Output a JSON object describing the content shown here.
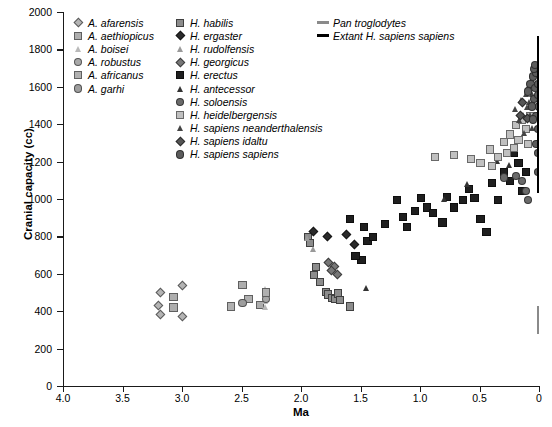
{
  "chart_data": {
    "type": "scatter",
    "title": "",
    "xlabel": "Ma",
    "ylabel": "Cranial capacity (cc)",
    "xlim": [
      4.0,
      0.0
    ],
    "ylim": [
      0,
      2000
    ],
    "x_reversed": true,
    "grid": false,
    "xticks": [
      "4.0",
      "3.5",
      "3.0",
      "2.5",
      "2.0",
      "1.5",
      "1.0",
      "0.5",
      "0"
    ],
    "xtick_values": [
      4.0,
      3.5,
      3.0,
      2.5,
      2.0,
      1.5,
      1.0,
      0.5,
      0.0
    ],
    "yticks": [
      "0",
      "200",
      "400",
      "600",
      "800",
      "1000",
      "1200",
      "1400",
      "1600",
      "1800",
      "2000"
    ],
    "ytick_values": [
      0,
      200,
      400,
      600,
      800,
      1000,
      1200,
      1400,
      1600,
      1800,
      2000
    ],
    "legend_position": "top",
    "series": [
      {
        "name": "A. afarensis",
        "marker": "diamond",
        "color": "#b4b4b4",
        "points": [
          [
            3.18,
            500
          ],
          [
            3.0,
            540
          ],
          [
            3.2,
            430
          ],
          [
            3.0,
            375
          ],
          [
            3.18,
            385
          ]
        ]
      },
      {
        "name": "A. aethiopicus",
        "marker": "square-open",
        "color": "#aeaeae",
        "points": [
          [
            3.08,
            480
          ],
          [
            3.08,
            425
          ],
          [
            2.5,
            545
          ],
          [
            2.35,
            440
          ]
        ]
      },
      {
        "name": "A. boisei",
        "marker": "triangle-open",
        "color": "#b9b9b9",
        "points": [
          [
            2.3,
            515
          ],
          [
            2.3,
            490
          ],
          [
            2.3,
            455
          ],
          [
            2.3,
            420
          ]
        ]
      },
      {
        "name": "A. robustus",
        "marker": "circle",
        "color": "#a8a8a8",
        "points": [
          [
            2.3,
            500
          ],
          [
            2.3,
            470
          ]
        ]
      },
      {
        "name": "A. africanus",
        "marker": "square-open",
        "color": "#b0b0b0",
        "points": [
          [
            2.6,
            430
          ],
          [
            2.45,
            470
          ],
          [
            2.3,
            505
          ]
        ]
      },
      {
        "name": "A. garhi",
        "marker": "circle",
        "color": "#9e9e9e",
        "points": [
          [
            2.5,
            450
          ]
        ]
      },
      {
        "name": "H. habilis",
        "marker": "square",
        "color": "#8c8c8c",
        "points": [
          [
            1.9,
            600
          ],
          [
            1.85,
            560
          ],
          [
            1.8,
            510
          ],
          [
            1.78,
            495
          ],
          [
            1.75,
            475
          ],
          [
            1.72,
            470
          ],
          [
            1.7,
            500
          ],
          [
            1.68,
            465
          ],
          [
            1.6,
            430
          ],
          [
            1.88,
            640
          ],
          [
            1.95,
            800
          ],
          [
            1.93,
            770
          ]
        ]
      },
      {
        "name": "H. ergaster",
        "marker": "diamond-filled",
        "color": "#2b2b2b",
        "points": [
          [
            1.9,
            830
          ],
          [
            1.78,
            800
          ],
          [
            1.62,
            810
          ],
          [
            1.55,
            760
          ]
        ]
      },
      {
        "name": "H. rudolfensis",
        "marker": "triangle-open",
        "color": "#9a9a9a",
        "points": [
          [
            1.95,
            790
          ],
          [
            1.9,
            730
          ]
        ]
      },
      {
        "name": "H. georgicus",
        "marker": "diamond",
        "color": "#777777",
        "points": [
          [
            1.77,
            660
          ],
          [
            1.72,
            640
          ],
          [
            1.75,
            620
          ],
          [
            1.7,
            600
          ]
        ]
      },
      {
        "name": "H. erectus",
        "marker": "square-filled",
        "color": "#1f1f1f",
        "points": [
          [
            1.6,
            900
          ],
          [
            1.48,
            855
          ],
          [
            1.45,
            780
          ],
          [
            1.4,
            800
          ],
          [
            1.3,
            870
          ],
          [
            1.2,
            1000
          ],
          [
            1.15,
            910
          ],
          [
            1.12,
            855
          ],
          [
            1.05,
            940
          ],
          [
            1.0,
            1010
          ],
          [
            0.95,
            960
          ],
          [
            0.9,
            930
          ],
          [
            0.82,
            880
          ],
          [
            0.78,
            1015
          ],
          [
            0.72,
            960
          ],
          [
            0.65,
            1000
          ],
          [
            0.6,
            1060
          ],
          [
            0.55,
            1010
          ],
          [
            0.5,
            900
          ],
          [
            0.45,
            830
          ],
          [
            0.4,
            1090
          ],
          [
            0.35,
            1000
          ],
          [
            0.3,
            1150
          ],
          [
            0.25,
            1100
          ],
          [
            0.22,
            1250
          ],
          [
            0.18,
            1200
          ],
          [
            0.15,
            1050
          ],
          [
            0.12,
            1150
          ],
          [
            1.5,
            680
          ],
          [
            1.55,
            700
          ]
        ]
      },
      {
        "name": "H. antecessor",
        "marker": "triangle-filled",
        "color": "#333333",
        "points": [
          [
            1.45,
            525
          ],
          [
            0.8,
            1000
          ],
          [
            0.6,
            1080
          ],
          [
            0.35,
            1200
          ],
          [
            0.25,
            1180
          ]
        ]
      },
      {
        "name": "H. soloensis",
        "marker": "circle",
        "color": "#6a6a6a",
        "points": [
          [
            0.15,
            1100
          ],
          [
            0.12,
            1050
          ],
          [
            0.1,
            1000
          ],
          [
            0.3,
            1120
          ],
          [
            0.2,
            1130
          ]
        ]
      },
      {
        "name": "H. heidelbergensis",
        "marker": "square-open",
        "color": "#c0c0c0",
        "points": [
          [
            0.72,
            1240
          ],
          [
            0.58,
            1220
          ],
          [
            0.5,
            1200
          ],
          [
            0.42,
            1270
          ],
          [
            0.4,
            1180
          ],
          [
            0.35,
            1230
          ],
          [
            0.3,
            1310
          ],
          [
            0.28,
            1250
          ],
          [
            0.25,
            1350
          ],
          [
            0.22,
            1280
          ],
          [
            0.2,
            1400
          ],
          [
            0.18,
            1320
          ],
          [
            0.15,
            1430
          ],
          [
            0.12,
            1380
          ],
          [
            0.88,
            1230
          ],
          [
            0.1,
            1300
          ],
          [
            0.08,
            1450
          ]
        ]
      },
      {
        "name": "H. sapiens neanderthalensis",
        "marker": "triangle-filled",
        "color": "#444444",
        "points": [
          [
            0.2,
            1480
          ],
          [
            0.17,
            1420
          ],
          [
            0.15,
            1530
          ],
          [
            0.13,
            1450
          ],
          [
            0.11,
            1560
          ],
          [
            0.1,
            1490
          ],
          [
            0.09,
            1600
          ],
          [
            0.08,
            1520
          ],
          [
            0.07,
            1450
          ],
          [
            0.06,
            1560
          ],
          [
            0.05,
            1620
          ],
          [
            0.04,
            1500
          ],
          [
            0.12,
            1350
          ],
          [
            0.06,
            1380
          ]
        ]
      },
      {
        "name": "H. sapiens idaltu",
        "marker": "diamond",
        "color": "#555555",
        "points": [
          [
            0.16,
            1450
          ],
          [
            0.14,
            1520
          ],
          [
            0.1,
            1430
          ]
        ]
      },
      {
        "name": "H. sapiens sapiens",
        "marker": "circle",
        "color": "#5c5c5c",
        "points": [
          [
            0.1,
            1580
          ],
          [
            0.08,
            1620
          ],
          [
            0.07,
            1500
          ],
          [
            0.06,
            1660
          ],
          [
            0.05,
            1540
          ],
          [
            0.04,
            1600
          ],
          [
            0.03,
            1450
          ],
          [
            0.03,
            1680
          ],
          [
            0.02,
            1560
          ],
          [
            0.02,
            1380
          ],
          [
            0.02,
            1250
          ],
          [
            0.02,
            1150
          ],
          [
            0.015,
            1620
          ],
          [
            0.01,
            1500
          ],
          [
            0.01,
            1700
          ],
          [
            0.05,
            1700
          ],
          [
            0.04,
            1720
          ],
          [
            0.03,
            1300
          ],
          [
            0.06,
            1430
          ]
        ]
      },
      {
        "name": "Pan troglodytes",
        "marker": "vbar",
        "color": "#8a8a8a",
        "range": [
          0.0,
          280,
          430
        ]
      },
      {
        "name": "Extant H. sapiens sapiens",
        "marker": "vbar",
        "color": "#000000",
        "range": [
          0.0,
          1030,
          1870
        ]
      }
    ],
    "legend_columns": [
      [
        {
          "label": "A. afarensis",
          "marker": "diamond",
          "color": "#b4b4b4"
        },
        {
          "label": "A. aethiopicus",
          "marker": "square-open",
          "color": "#aeaeae"
        },
        {
          "label": "A. boisei",
          "marker": "triangle-open",
          "color": "#b9b9b9"
        },
        {
          "label": "A. robustus",
          "marker": "circle",
          "color": "#a8a8a8"
        },
        {
          "label": "A. africanus",
          "marker": "square-open",
          "color": "#b0b0b0"
        },
        {
          "label": "A. garhi",
          "marker": "circle",
          "color": "#9e9e9e"
        }
      ],
      [
        {
          "label": "H. habilis",
          "marker": "square",
          "color": "#8c8c8c"
        },
        {
          "label": "H. ergaster",
          "marker": "diamond-filled",
          "color": "#2b2b2b"
        },
        {
          "label": "H. rudolfensis",
          "marker": "triangle-open",
          "color": "#9a9a9a"
        },
        {
          "label": "H. georgicus",
          "marker": "diamond",
          "color": "#777777"
        },
        {
          "label": "H. erectus",
          "marker": "square-filled",
          "color": "#1f1f1f"
        },
        {
          "label": "H. antecessor",
          "marker": "triangle-filled",
          "color": "#333333"
        },
        {
          "label": "H. soloensis",
          "marker": "circle",
          "color": "#6a6a6a"
        },
        {
          "label": "H. heidelbergensis",
          "marker": "square-open",
          "color": "#c0c0c0"
        },
        {
          "label": "H. sapiens neanderthalensis",
          "marker": "triangle-filled",
          "color": "#444444"
        },
        {
          "label": "H. sapiens idaltu",
          "marker": "diamond",
          "color": "#555555"
        },
        {
          "label": "H. sapiens sapiens",
          "marker": "circle",
          "color": "#5c5c5c"
        }
      ],
      [
        {
          "label": "Pan troglodytes",
          "marker": "line",
          "color": "#8a8a8a"
        },
        {
          "label": "Extant H. sapiens sapiens",
          "marker": "line",
          "color": "#000000"
        }
      ]
    ]
  }
}
